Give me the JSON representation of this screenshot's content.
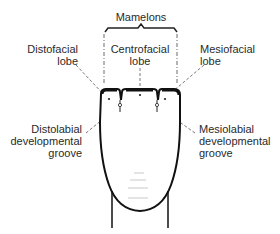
{
  "diagram": {
    "labels": {
      "mamelons": "Mamelons",
      "distofacial": [
        "Distofacial",
        "lobe"
      ],
      "centrofacial": [
        "Centrofacial",
        "lobe"
      ],
      "mesiofacial": [
        "Mesiofacial",
        "lobe"
      ],
      "distolabial": [
        "Distolabial",
        "developmental",
        "groove"
      ],
      "mesiolabial": [
        "Mesiolabial",
        "developmental",
        "groove"
      ]
    }
  }
}
